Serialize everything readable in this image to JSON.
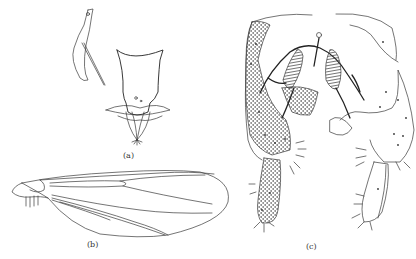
{
  "figure": {
    "panels": [
      {
        "id": "a",
        "label": "(a)",
        "subject": "genitalia structures (lateral and ventral views)"
      },
      {
        "id": "b",
        "label": "(b)",
        "subject": "wing venation"
      },
      {
        "id": "c",
        "label": "(c)",
        "subject": "hypopygium with gonocoxites and gonostyli"
      }
    ]
  },
  "colors": {
    "background": "#ffffff",
    "ink": "#333333"
  }
}
